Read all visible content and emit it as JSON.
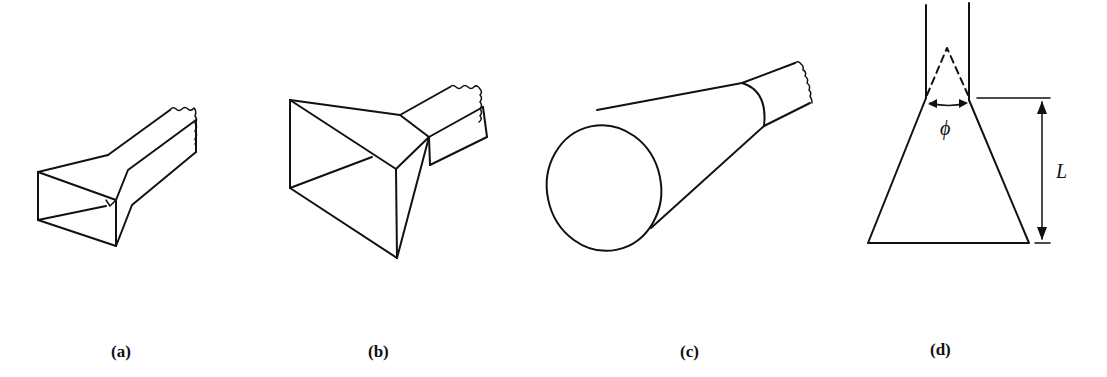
{
  "figure": {
    "panels": [
      {
        "id": "a",
        "label": "(a)",
        "description": "E-plane sectoral horn with waveguide feed"
      },
      {
        "id": "b",
        "label": "(b)",
        "description": "Pyramidal horn with rectangular waveguide feed"
      },
      {
        "id": "c",
        "label": "(c)",
        "description": "Conical horn with circular waveguide feed"
      },
      {
        "id": "d",
        "label": "(d)",
        "description": "Horn cross-section with flare angle and length"
      }
    ],
    "annotations": {
      "flare_angle_symbol": "ϕ",
      "length_symbol": "L"
    }
  }
}
